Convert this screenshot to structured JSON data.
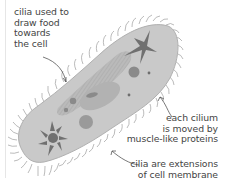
{
  "diagram": {
    "colors": {
      "cell_body": "#c7c7c7",
      "cell_outline": "#b3b3b3",
      "organelle_dark": "#6e6e6e",
      "organelle_mid": "#8f8f8f",
      "groove": "#adadad",
      "cilia": "#9a9a9a",
      "leader": "#555555",
      "text": "#444444"
    },
    "labels": [
      {
        "id": "food",
        "lines": [
          "cilia used to",
          "draw food",
          "towards",
          "the cell"
        ]
      },
      {
        "id": "cilium",
        "lines": [
          "each cilium",
          "is moved by",
          "muscle-like proteins"
        ]
      },
      {
        "id": "extension",
        "lines": [
          "cilia are extensions",
          "of cell membrane"
        ]
      }
    ]
  }
}
